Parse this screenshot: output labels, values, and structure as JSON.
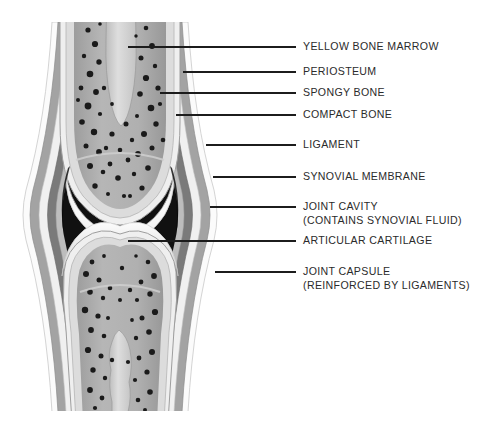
{
  "diagram": {
    "background_color": "#ffffff",
    "text_color": "#2b2b2b",
    "leader_color": "#1c1c1c",
    "labels": [
      {
        "id": "yellow-bone-marrow",
        "line1": "YELLOW BONE MARROW",
        "line2": "",
        "text_x": 303,
        "text_y": 47,
        "leader_x1": 128,
        "leader_y1": 47,
        "leader_x2": 296,
        "leader_y2": 47
      },
      {
        "id": "periosteum",
        "line1": "PERIOSTEUM",
        "line2": "",
        "text_x": 303,
        "text_y": 72,
        "leader_x1": 183,
        "leader_y1": 72,
        "leader_x2": 296,
        "leader_y2": 72
      },
      {
        "id": "spongy-bone",
        "line1": "SPONGY BONE",
        "line2": "",
        "text_x": 303,
        "text_y": 93,
        "leader_x1": 160,
        "leader_y1": 93,
        "leader_x2": 296,
        "leader_y2": 93
      },
      {
        "id": "compact-bone",
        "line1": "COMPACT BONE",
        "line2": "",
        "text_x": 303,
        "text_y": 115,
        "leader_x1": 176,
        "leader_y1": 115,
        "leader_x2": 296,
        "leader_y2": 115
      },
      {
        "id": "ligament",
        "line1": "LIGAMENT",
        "line2": "",
        "text_x": 303,
        "text_y": 145,
        "leader_x1": 206,
        "leader_y1": 145,
        "leader_x2": 296,
        "leader_y2": 145
      },
      {
        "id": "synovial-membrane",
        "line1": "SYNOVIAL MEMBRANE",
        "line2": "",
        "text_x": 303,
        "text_y": 177,
        "leader_x1": 213,
        "leader_y1": 177,
        "leader_x2": 296,
        "leader_y2": 177
      },
      {
        "id": "joint-cavity",
        "line1": "JOINT CAVITY",
        "line2": "(CONTAINS SYNOVIAL FLUID)",
        "text_x": 303,
        "text_y": 207,
        "leader_x1": 210,
        "leader_y1": 207,
        "leader_x2": 296,
        "leader_y2": 207
      },
      {
        "id": "articular-cartilage",
        "line1": "ARTICULAR CARTILAGE",
        "line2": "",
        "text_x": 303,
        "text_y": 241,
        "leader_x1": 128,
        "leader_y1": 241,
        "leader_x2": 296,
        "leader_y2": 241
      },
      {
        "id": "joint-capsule",
        "line1": "JOINT CAPSULE",
        "line2": "(REINFORCED BY LIGAMENTS)",
        "text_x": 303,
        "text_y": 272,
        "leader_x1": 215,
        "leader_y1": 272,
        "leader_x2": 296,
        "leader_y2": 272
      }
    ],
    "illustration": {
      "center_x": 120,
      "top_y": 22,
      "bottom_y": 412,
      "colors": {
        "outer_white": "#fbfbfb",
        "capsule_gray": "#9a9a9a",
        "ligament_dark": "#6f6f6f",
        "membrane_mid": "#b4b4b4",
        "cavity_black": "#111111",
        "cartilage_white": "#f4f4f4",
        "compact_bone": "#d8d8d8",
        "spongy_bone": "#a8a8a8",
        "marrow_light": "#d0d0d0",
        "speckle": "#1a1a1a"
      }
    }
  }
}
